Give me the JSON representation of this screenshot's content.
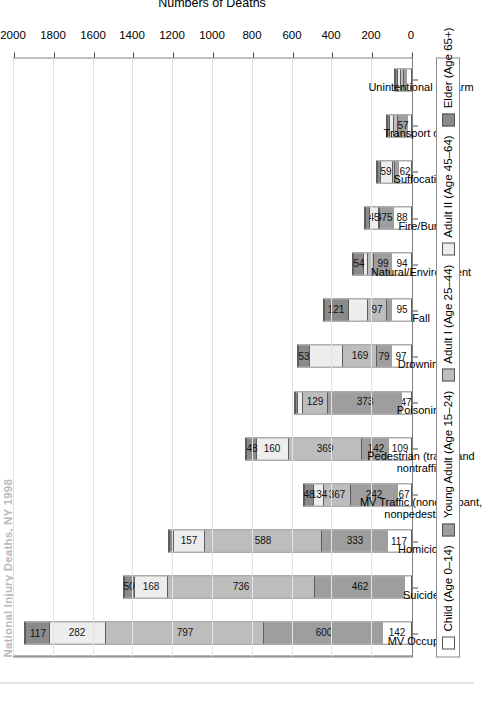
{
  "figure": {
    "title": "National Injury Deaths, NY 1998",
    "yaxis_title": "Numbers of Deaths"
  },
  "legend": {
    "items": [
      {
        "label": "Child (Age 0–14)",
        "color": "#ffffff"
      },
      {
        "label": "Young Adult (Age 15–24)",
        "color": "#9e9e9e"
      },
      {
        "label": "Adult I (Age 25–44)",
        "color": "#bdbdbd"
      },
      {
        "label": "Adult II (Age 45–64)",
        "color": "#ededed"
      },
      {
        "label": "Elder (Age 65+)",
        "color": "#8a8a8a"
      }
    ]
  },
  "chart_data": {
    "type": "bar",
    "subtype": "stacked-bar",
    "title": "National Injury Deaths, NY 1998",
    "xlabel": "",
    "ylabel": "Numbers of Deaths",
    "ylim": [
      0,
      2000
    ],
    "yticks": [
      0,
      200,
      400,
      600,
      800,
      1000,
      1200,
      1400,
      1600,
      1800,
      2000
    ],
    "grid": true,
    "legend_position": "bottom",
    "orientation": "vertical-bars-rotated-page",
    "categories": [
      "MV Occupant",
      "Suicide",
      "Homicide",
      "MV Traffic (nonoccupant,\nnonpedestrian)",
      "Pedestrian (traffic and\nnontraffic)",
      "Poisoning",
      "Drowning",
      "Fall",
      "Natural/Environment",
      "Fire/Burn",
      "Suffocation",
      "Transport other",
      "Unintentional Firearm"
    ],
    "series": [
      {
        "name": "Child (Age 0–14)",
        "color": "#ffffff",
        "values": [
          142,
          28,
          117,
          67,
          109,
          47,
          97,
          95,
          94,
          88,
          62,
          14,
          18
        ]
      },
      {
        "name": "Young Adult (Age 15–24)",
        "color": "#9e9e9e",
        "values": [
          600,
          462,
          333,
          242,
          142,
          373,
          79,
          30,
          99,
          75,
          22,
          57,
          22
        ]
      },
      {
        "name": "Adult I (Age 25–44)",
        "color": "#bdbdbd",
        "values": [
          797,
          736,
          588,
          134,
          369,
          129,
          169,
          95,
          28,
          4,
          14,
          22,
          16
        ]
      },
      {
        "name": "Adult II (Age 45–64)",
        "color": "#ededed",
        "values": [
          282,
          168,
          157,
          48,
          160,
          22,
          169,
          97,
          18,
          45,
          59,
          16,
          14
        ]
      },
      {
        "name": "Elder (Age 65+)",
        "color": "#8a8a8a",
        "values": [
          117,
          50,
          22,
          48,
          48,
          12,
          53,
          121,
          54,
          18,
          16,
          12,
          10
        ]
      }
    ],
    "visible_segment_labels": [
      {
        "category": "MV Occupant",
        "labels": [
          "142",
          "600",
          "797",
          "282",
          "117"
        ]
      },
      {
        "category": "Suicide",
        "labels": [
          "",
          "462",
          "736",
          "168",
          "50"
        ]
      },
      {
        "category": "Homicide",
        "labels": [
          "117",
          "333",
          "588",
          "157",
          ""
        ]
      },
      {
        "category": "MV Traffic (nonoccupant, nonpedestrian)",
        "labels": [
          "67",
          "242",
          "367",
          "134",
          "48"
        ]
      },
      {
        "category": "Pedestrian (traffic and nontraffic)",
        "labels": [
          "109",
          "142",
          "369",
          "160",
          "48"
        ]
      },
      {
        "category": "Poisoning",
        "labels": [
          "47",
          "373",
          "129",
          "",
          ""
        ]
      },
      {
        "category": "Drowning",
        "labels": [
          "97",
          "79",
          "169",
          "",
          "53"
        ]
      },
      {
        "category": "Fall",
        "labels": [
          "95",
          "",
          "97",
          "",
          "121"
        ]
      },
      {
        "category": "Natural/Environment",
        "labels": [
          "94",
          "99",
          "",
          "",
          "54"
        ]
      },
      {
        "category": "Fire/Burn",
        "labels": [
          "88",
          "75",
          "4",
          "45",
          ""
        ]
      },
      {
        "category": "Suffocation",
        "labels": [
          "62",
          "",
          "",
          "59",
          ""
        ]
      },
      {
        "category": "Transport other",
        "labels": [
          "",
          "57",
          "",
          "",
          ""
        ]
      },
      {
        "category": "Unintentional Firearm",
        "labels": [
          "",
          "",
          "",
          "",
          ""
        ]
      }
    ]
  }
}
